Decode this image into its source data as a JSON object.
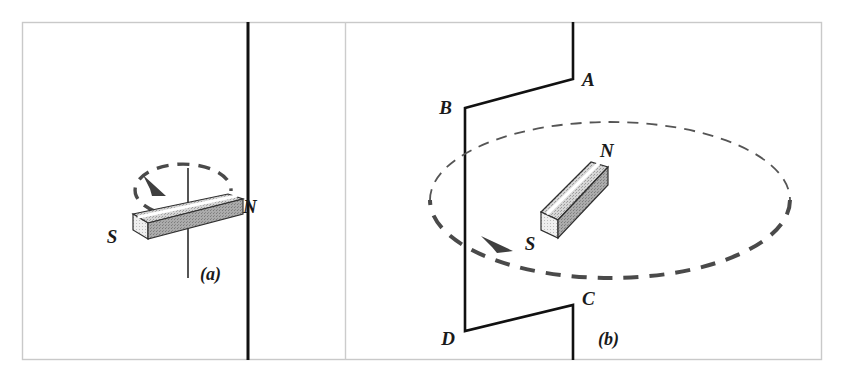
{
  "figure": {
    "background_color": "#ffffff",
    "frame_color": "#c8c8c8",
    "divider_color": "#000000",
    "ink_color": "#1a1a1a",
    "magnet_top_color": "#d2d2d2",
    "magnet_side_color": "#a8a8a8",
    "magnet_cap_color": "#f0f0f0",
    "magnet_highlight_color": "#ffffff",
    "dash_color": "#4a4a4a"
  },
  "panels": [
    {
      "id": "a",
      "caption": "(a)",
      "description": "Bar magnet spinning about a vertical axis",
      "axis": {
        "label": "rotation-axis",
        "x": 188,
        "y_top": 168,
        "y_bottom": 278
      },
      "magnet": {
        "south_label": "S",
        "north_label": "N",
        "south_label_x": 112,
        "south_label_y": 243,
        "north_label_x": 243,
        "north_label_y": 213
      },
      "rotation_arrow": {
        "direction": "clockwise-viewed-from-above",
        "arrowhead_x": 155,
        "arrowhead_y": 189
      },
      "caption_x": 200,
      "caption_y": 277
    },
    {
      "id": "b",
      "caption": "(b)",
      "description": "Bar magnet rotating inside a conducting loop A-B-C-D",
      "nodes": [
        {
          "label": "A",
          "x": 573,
          "y": 79,
          "label_x": 582,
          "label_y": 85
        },
        {
          "label": "B",
          "x": 465,
          "y": 108,
          "label_x": 443,
          "label_y": 114
        },
        {
          "label": "C",
          "x": 573,
          "y": 305,
          "label_x": 582,
          "label_y": 304
        },
        {
          "label": "D",
          "x": 465,
          "y": 331,
          "label_x": 442,
          "label_y": 344
        }
      ],
      "magnet": {
        "south_label": "S",
        "north_label": "N",
        "south_label_x": 530,
        "south_label_y": 243,
        "north_label_x": 600,
        "north_label_y": 157
      },
      "rotation_ellipse": {
        "center_x": 610,
        "center_y": 200,
        "radius_x": 180,
        "radius_y": 78,
        "arrowhead_x": 503,
        "arrowhead_y": 249
      },
      "caption_x": 610,
      "caption_y": 345
    }
  ],
  "layout": {
    "frame": {
      "x": 22,
      "y": 22,
      "width": 800,
      "height": 338
    },
    "divider_x": 248,
    "panel_b_border_x": 345
  }
}
